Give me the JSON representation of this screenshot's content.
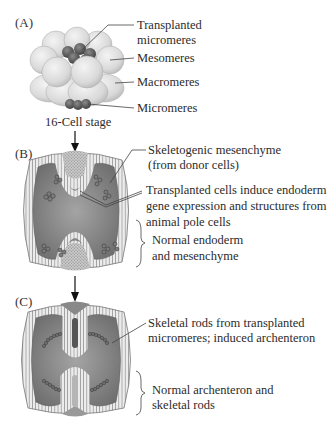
{
  "panels": {
    "a": {
      "letter": "(A)",
      "caption": "16-Cell stage",
      "labels": {
        "transplanted_1": "Transplanted",
        "transplanted_2": "micromeres",
        "mesomeres": "Mesomeres",
        "macromeres": "Macromeres",
        "micromeres": "Micromeres"
      }
    },
    "b": {
      "letter": "(B)",
      "labels": {
        "skeletogenic_1": "Skeletogenic mesenchyme",
        "skeletogenic_2": "(from donor cells)",
        "induce_1": "Transplanted cells induce endoderm",
        "induce_2": "gene expression and structures from",
        "induce_3": "animal pole cells",
        "normal_1": "Normal endoderm",
        "normal_2": "and mesenchyme"
      }
    },
    "c": {
      "letter": "(C)",
      "labels": {
        "rods_1": "Skeletal rods from transplanted",
        "rods_2": "micromeres; induced archenteron",
        "normal_1": "Normal archenteron and",
        "normal_2": "skeletal rods"
      }
    }
  },
  "colors": {
    "cell_light": "#e4e4e4",
    "cell_dark": "#5a5a5a",
    "blastocoel": "#8a8a8a",
    "epithelium": "#e9e9e9",
    "line": "#555555"
  }
}
